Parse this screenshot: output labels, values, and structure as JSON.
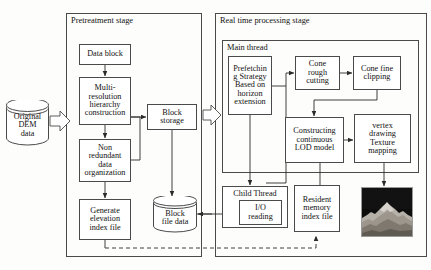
{
  "diagram": {
    "title_hidden": "",
    "groups": [
      {
        "key": "pretreatment",
        "label": "Pretreatment stage"
      },
      {
        "key": "realtime",
        "label": "Real time processing stage"
      },
      {
        "key": "mainthread",
        "label": "Main thread"
      }
    ],
    "nodes": {
      "original_dem": "Original\nDEM\ndata",
      "data_block": "Data block",
      "multi_resolution": "Multi-\nresolution\nhierarchy\nconstruction",
      "non_redundant": "Non\nredundant\ndata\norganization",
      "generate_index": "Generate\nelevation\nindex file",
      "block_storage": "Block\nstorage",
      "block_file_data": "Block\nfile data",
      "prefetching": "Prefetchin\ng Strategy\nBased on\nhorizon\nextension",
      "cone_rough": "Cone\nrough\ncutting",
      "cone_fine": "Cone fine\nclipping",
      "constructing_lod": "Constructing\ncontinuous\nLOD model",
      "vertex_drawing": "vertex\ndrawing\nTexture\nmapping",
      "child_thread": "Child Thread",
      "io_reading": "I/O\nreading",
      "resident_memory": "Resident\nmemory\nindex file",
      "terrain_image": ""
    },
    "colors": {
      "stroke": "#4a4a4a",
      "text": "#111111",
      "background": "#fdfdfb",
      "image_sky": "#111111",
      "image_terrain": "#b9b4ac"
    }
  }
}
